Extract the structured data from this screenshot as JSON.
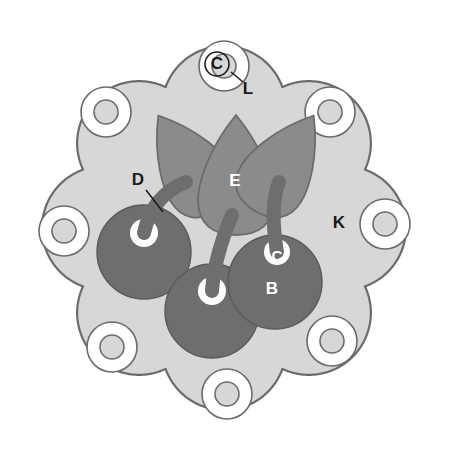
{
  "figure": {
    "type": "labeled-diagram",
    "canvas": {
      "width": 449,
      "height": 457
    },
    "background_color": "#ffffff"
  },
  "colors": {
    "matrix_fill": "#d7d7d7",
    "matrix_stroke": "#6b6b6b",
    "ring_fill": "#ffffff",
    "ring_stroke": "#6b6b6b",
    "petal_fill": "#8b8b8b",
    "petal_stroke": "#6b6b6b",
    "circle_fill": "#6e6e6e",
    "circle_stroke": "#5a5a5a",
    "stem_fill": "#6e6e6e",
    "notch_fill": "#ffffff",
    "label_dark": "#1a1a1a",
    "label_light": "#ffffff",
    "leader_stroke": "#1a1a1a"
  },
  "labels": [
    {
      "id": "label-c-top",
      "text": "C",
      "x": 217,
      "y": 64,
      "size": 17,
      "tone": "dark",
      "circled": true
    },
    {
      "id": "label-l",
      "text": "L",
      "x": 248,
      "y": 89,
      "size": 17,
      "tone": "dark",
      "circled": false
    },
    {
      "id": "label-d",
      "text": "D",
      "x": 138,
      "y": 180,
      "size": 17,
      "tone": "dark",
      "circled": false
    },
    {
      "id": "label-e",
      "text": "E",
      "x": 235,
      "y": 181,
      "size": 17,
      "tone": "light",
      "circled": false
    },
    {
      "id": "label-k",
      "text": "K",
      "x": 339,
      "y": 223,
      "size": 17,
      "tone": "dark",
      "circled": false
    },
    {
      "id": "label-c-inner",
      "text": "C",
      "x": 277,
      "y": 257,
      "size": 15,
      "tone": "light",
      "circled": false
    },
    {
      "id": "label-b",
      "text": "B",
      "x": 272,
      "y": 289,
      "size": 17,
      "tone": "light",
      "circled": false
    }
  ],
  "leaders": [
    {
      "id": "leader-l",
      "x1": 231,
      "y1": 72,
      "x2": 243,
      "y2": 82
    },
    {
      "id": "leader-d",
      "x1": 146,
      "y1": 190,
      "x2": 163,
      "y2": 212
    }
  ],
  "lobes": {
    "count": 8,
    "center": {
      "x": 224,
      "y": 228
    },
    "body_radius": 128,
    "lobe_radius": 62,
    "lobe_orbit_radius": 120,
    "start_angle_deg": -90
  },
  "rings": {
    "count": 8,
    "outer_radius": 25,
    "inner_radius": 12,
    "orbit_radius": 118,
    "centers": [
      {
        "id": "ring-top",
        "x": 224,
        "y": 66
      },
      {
        "id": "ring-top-right",
        "x": 330,
        "y": 112
      },
      {
        "id": "ring-right",
        "x": 385,
        "y": 224
      },
      {
        "id": "ring-bottom-right",
        "x": 332,
        "y": 341
      },
      {
        "id": "ring-bottom",
        "x": 227,
        "y": 394
      },
      {
        "id": "ring-bottom-left",
        "x": 112,
        "y": 347
      },
      {
        "id": "ring-left",
        "x": 64,
        "y": 231
      },
      {
        "id": "ring-top-left",
        "x": 106,
        "y": 112
      }
    ]
  },
  "petals": [
    {
      "id": "petal-left",
      "cx": 188,
      "cy": 163,
      "rx": 35,
      "ry": 56,
      "rotate": -32
    },
    {
      "id": "petal-center",
      "cx": 236,
      "cy": 175,
      "rx": 38,
      "ry": 60,
      "rotate": 0
    },
    {
      "id": "petal-right",
      "cx": 284,
      "cy": 163,
      "rx": 35,
      "ry": 56,
      "rotate": 32
    }
  ],
  "circles": [
    {
      "id": "circle-left",
      "cx": 144,
      "cy": 252,
      "r": 47,
      "notch_x": 144,
      "notch_y": 233,
      "notch_r": 14
    },
    {
      "id": "circle-bottom",
      "cx": 212,
      "cy": 311,
      "r": 47,
      "notch_x": 212,
      "notch_y": 291,
      "notch_r": 14
    },
    {
      "id": "circle-right",
      "cx": 275,
      "cy": 282,
      "r": 47,
      "notch_x": 277,
      "notch_y": 252,
      "notch_r": 13
    }
  ],
  "stems": [
    {
      "id": "stem-left",
      "d": "M 144 233 C 150 205 166 190 186 182",
      "width": 14
    },
    {
      "id": "stem-center",
      "d": "M 212 291 C 214 260 224 234 232 215",
      "width": 14
    },
    {
      "id": "stem-right",
      "d": "M 277 252 C 272 222 272 200 279 182",
      "width": 14
    }
  ]
}
